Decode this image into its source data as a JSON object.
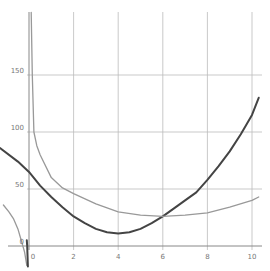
{
  "chart_data": {
    "type": "line",
    "title": "",
    "xlabel": "",
    "ylabel": "",
    "xlim": [
      -1.3,
      10.5
    ],
    "ylim": [
      -20,
      205
    ],
    "grid": true,
    "legend": null,
    "x_ticks": [
      0,
      2,
      4,
      6,
      8,
      10
    ],
    "y_ticks": [
      0,
      50,
      100,
      150
    ],
    "x_tick_labels": [
      "0",
      "2",
      "4",
      "6",
      "8",
      "10"
    ],
    "y_tick_labels": [
      "0",
      "50",
      "100",
      "150"
    ],
    "series": [
      {
        "name": "dark-curve",
        "color": "#444444",
        "points": [
          [
            -1.3,
            86
          ],
          [
            -0.5,
            74
          ],
          [
            0,
            65
          ],
          [
            0.5,
            53
          ],
          [
            1,
            43
          ],
          [
            1.5,
            34
          ],
          [
            2,
            26
          ],
          [
            2.5,
            20
          ],
          [
            3,
            15
          ],
          [
            3.5,
            12
          ],
          [
            4,
            11
          ],
          [
            4.5,
            12
          ],
          [
            5,
            15
          ],
          [
            5.5,
            20
          ],
          [
            6,
            26
          ],
          [
            6.5,
            33
          ],
          [
            7,
            40
          ],
          [
            7.5,
            47
          ],
          [
            8,
            58
          ],
          [
            8.5,
            70
          ],
          [
            9,
            83
          ],
          [
            9.5,
            98
          ],
          [
            10,
            115
          ],
          [
            10.3,
            130
          ]
        ]
      },
      {
        "name": "light-curve-right-branch",
        "color": "#999999",
        "points": [
          [
            0.1,
            205
          ],
          [
            0.15,
            150
          ],
          [
            0.22,
            100
          ],
          [
            0.35,
            88
          ],
          [
            0.5,
            80
          ],
          [
            1,
            60
          ],
          [
            1.5,
            51
          ],
          [
            2,
            46
          ],
          [
            3,
            37
          ],
          [
            4,
            30
          ],
          [
            5,
            27
          ],
          [
            6,
            26
          ],
          [
            7,
            27
          ],
          [
            8,
            29
          ],
          [
            9,
            34
          ],
          [
            10,
            40
          ],
          [
            10.3,
            43
          ]
        ]
      },
      {
        "name": "light-curve-left-branch",
        "color": "#999999",
        "points": [
          [
            -1.15,
            36
          ],
          [
            -0.9,
            30
          ],
          [
            -0.7,
            24
          ],
          [
            -0.5,
            15
          ],
          [
            -0.35,
            5
          ],
          [
            -0.2,
            -5
          ],
          [
            -0.1,
            -17
          ]
        ]
      },
      {
        "name": "dark-curve-left-asymptote",
        "color": "#444444",
        "points": [
          [
            -0.05,
            -18
          ],
          [
            -0.08,
            0
          ],
          [
            -0.1,
            5
          ]
        ]
      }
    ]
  },
  "colors": {
    "grid": "#bbbbbb",
    "axis": "#888888",
    "dark": "#444444",
    "light": "#999999",
    "label": "#777777"
  }
}
